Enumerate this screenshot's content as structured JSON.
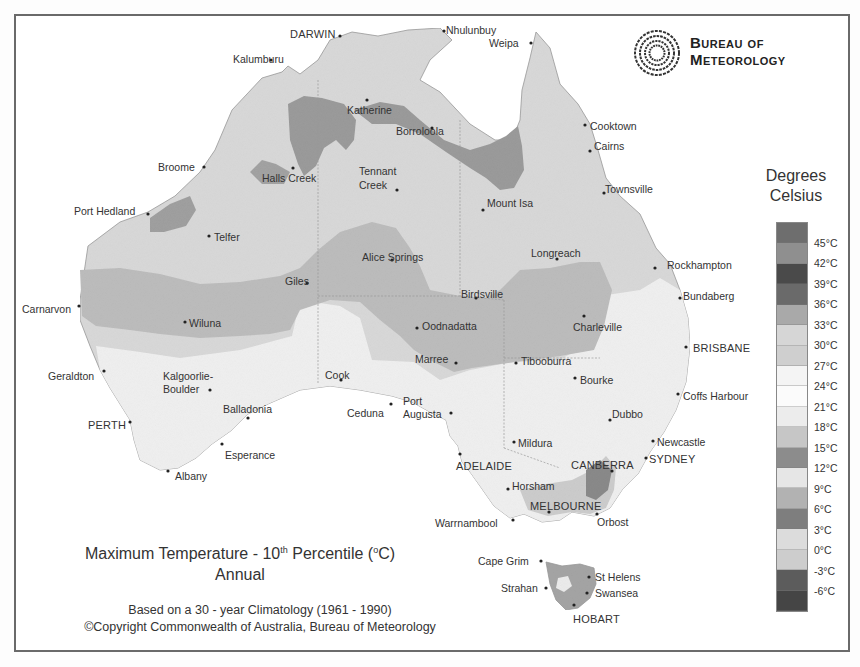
{
  "logo": {
    "line1": "Bureau of",
    "line2": "Meteorology",
    "icon": "swirl-logo-icon"
  },
  "legend": {
    "title_line1": "Degrees",
    "title_line2": "Celsius",
    "labels": [
      "45°C",
      "42°C",
      "39°C",
      "36°C",
      "33°C",
      "30°C",
      "27°C",
      "24°C",
      "21°C",
      "18°C",
      "15°C",
      "12°C",
      "9°C",
      "6°C",
      "3°C",
      "0°C",
      "-3°C",
      "-6°C"
    ],
    "band_colors": [
      "#6e6e6e",
      "#8f8f8f",
      "#4a4a4a",
      "#6a6a6a",
      "#a9a9a9",
      "#d6d6d6",
      "#cfcfcf",
      "#f4f4f4",
      "#fbfbfb",
      "#ececec",
      "#c6c6c6",
      "#8c8c8c",
      "#e6e6e6",
      "#b2b2b2",
      "#7e7e7e",
      "#dcdcdc",
      "#cdcdcd",
      "#5c5c5c",
      "#454545"
    ]
  },
  "title": {
    "main_prefix": "Maximum Temperature - 10",
    "main_sup": "th",
    "main_suffix": " Percentile (",
    "deg_sup": "o",
    "main_end": "C)",
    "sub": "Annual"
  },
  "footer": {
    "line1": "Based on a 30 - year Climatology (1961 - 1990)",
    "line2": "©Copyright Commonwealth of Australia, Bureau of Meteorology"
  },
  "towns": [
    {
      "name": "DARWIN",
      "x": 290,
      "y": 28,
      "dx": 340,
      "dy": 36
    },
    {
      "name": "Nhulunbuy",
      "x": 446,
      "y": 24,
      "dx": 444,
      "dy": 31
    },
    {
      "name": "Weipa",
      "x": 489,
      "y": 37,
      "dx": 531,
      "dy": 43
    },
    {
      "name": "Kalumburu",
      "x": 233,
      "y": 53,
      "dx": 271,
      "dy": 60
    },
    {
      "name": "Katherine",
      "x": 347,
      "y": 104,
      "dx": 367,
      "dy": 100
    },
    {
      "name": "Borroloola",
      "x": 396,
      "y": 125,
      "dx": 432,
      "dy": 128
    },
    {
      "name": "Cooktown",
      "x": 590,
      "y": 120,
      "dx": 585,
      "dy": 125
    },
    {
      "name": "Cairns",
      "x": 594,
      "y": 140,
      "dx": 590,
      "dy": 151
    },
    {
      "name": "Broome",
      "x": 158,
      "y": 161,
      "dx": 204,
      "dy": 167
    },
    {
      "name": "Halls Creek",
      "x": 262,
      "y": 172,
      "dx": 293,
      "dy": 168
    },
    {
      "name": "Tennant",
      "x": 359,
      "y": 165,
      "dx": 397,
      "dy": 190
    },
    {
      "name": "Creek",
      "x": 359,
      "y": 179,
      "dx": null,
      "dy": null
    },
    {
      "name": "Townsville",
      "x": 605,
      "y": 183,
      "dx": 604,
      "dy": 193
    },
    {
      "name": "Mount Isa",
      "x": 487,
      "y": 197,
      "dx": 483,
      "dy": 210
    },
    {
      "name": "Port Hedland",
      "x": 74,
      "y": 205,
      "dx": 148,
      "dy": 214
    },
    {
      "name": "Telfer",
      "x": 214,
      "y": 231,
      "dx": 209,
      "dy": 236
    },
    {
      "name": "Alice Springs",
      "x": 362,
      "y": 251,
      "dx": 392,
      "dy": 260
    },
    {
      "name": "Longreach",
      "x": 531,
      "y": 247,
      "dx": 557,
      "dy": 259
    },
    {
      "name": "Rockhampton",
      "x": 667,
      "y": 259,
      "dx": 655,
      "dy": 268
    },
    {
      "name": "Giles",
      "x": 285,
      "y": 275,
      "dx": 307,
      "dy": 283
    },
    {
      "name": "Birdsville",
      "x": 461,
      "y": 288,
      "dx": 476,
      "dy": 298
    },
    {
      "name": "Bundaberg",
      "x": 683,
      "y": 290,
      "dx": 680,
      "dy": 298
    },
    {
      "name": "Carnarvon",
      "x": 22,
      "y": 303,
      "dx": 79,
      "dy": 306
    },
    {
      "name": "Wiluna",
      "x": 189,
      "y": 317,
      "dx": 185,
      "dy": 322
    },
    {
      "name": "Oodnadatta",
      "x": 422,
      "y": 320,
      "dx": 417,
      "dy": 328
    },
    {
      "name": "Charleville",
      "x": 573,
      "y": 321,
      "dx": 584,
      "dy": 316
    },
    {
      "name": "BRISBANE",
      "x": 693,
      "y": 342,
      "dx": 686,
      "dy": 347
    },
    {
      "name": "Marree",
      "x": 415,
      "y": 353,
      "dx": 456,
      "dy": 363
    },
    {
      "name": "Tibooburra",
      "x": 521,
      "y": 355,
      "dx": 516,
      "dy": 363
    },
    {
      "name": "Geraldton",
      "x": 48,
      "y": 370,
      "dx": 104,
      "dy": 371
    },
    {
      "name": "Cook",
      "x": 325,
      "y": 369,
      "dx": 341,
      "dy": 380
    },
    {
      "name": "Bourke",
      "x": 580,
      "y": 374,
      "dx": 575,
      "dy": 378
    },
    {
      "name": "Kalgoorlie-",
      "x": 163,
      "y": 370,
      "dx": null,
      "dy": null
    },
    {
      "name": "Boulder",
      "x": 163,
      "y": 383,
      "dx": 210,
      "dy": 390
    },
    {
      "name": "Coffs Harbour",
      "x": 683,
      "y": 390,
      "dx": 678,
      "dy": 394
    },
    {
      "name": "Port",
      "x": 403,
      "y": 395,
      "dx": null,
      "dy": null
    },
    {
      "name": "Augusta",
      "x": 403,
      "y": 408,
      "dx": 451,
      "dy": 413
    },
    {
      "name": "Balladonia",
      "x": 223,
      "y": 403,
      "dx": 248,
      "dy": 418
    },
    {
      "name": "Ceduna",
      "x": 347,
      "y": 407,
      "dx": 391,
      "dy": 404
    },
    {
      "name": "Dubbo",
      "x": 612,
      "y": 408,
      "dx": 610,
      "dy": 420
    },
    {
      "name": "PERTH",
      "x": 88,
      "y": 419,
      "dx": 130,
      "dy": 422
    },
    {
      "name": "Mildura",
      "x": 518,
      "y": 437,
      "dx": 514,
      "dy": 442
    },
    {
      "name": "Esperance",
      "x": 225,
      "y": 449,
      "dx": 222,
      "dy": 444
    },
    {
      "name": "Newcastle",
      "x": 657,
      "y": 436,
      "dx": 653,
      "dy": 441
    },
    {
      "name": "ADELAIDE",
      "x": 456,
      "y": 460,
      "dx": 460,
      "dy": 454
    },
    {
      "name": "CANBERRA",
      "x": 571,
      "y": 459,
      "dx": 612,
      "dy": 471
    },
    {
      "name": "SYDNEY",
      "x": 649,
      "y": 453,
      "dx": 646,
      "dy": 458
    },
    {
      "name": "Albany",
      "x": 175,
      "y": 470,
      "dx": 168,
      "dy": 471
    },
    {
      "name": "Horsham",
      "x": 512,
      "y": 480,
      "dx": 508,
      "dy": 489
    },
    {
      "name": "MELBOURNE",
      "x": 530,
      "y": 500,
      "dx": 549,
      "dy": 512
    },
    {
      "name": "Warrnambool",
      "x": 435,
      "y": 517,
      "dx": 513,
      "dy": 520
    },
    {
      "name": "Orbost",
      "x": 597,
      "y": 516,
      "dx": 597,
      "dy": 514
    },
    {
      "name": "Cape Grim",
      "x": 478,
      "y": 555,
      "dx": 541,
      "dy": 561
    },
    {
      "name": "St Helens",
      "x": 595,
      "y": 571,
      "dx": 589,
      "dy": 577
    },
    {
      "name": "Strahan",
      "x": 501,
      "y": 582,
      "dx": 546,
      "dy": 588
    },
    {
      "name": "Swansea",
      "x": 595,
      "y": 587,
      "dx": 587,
      "dy": 593
    },
    {
      "name": "HOBART",
      "x": 573,
      "y": 613,
      "dx": 574,
      "dy": 605
    }
  ]
}
